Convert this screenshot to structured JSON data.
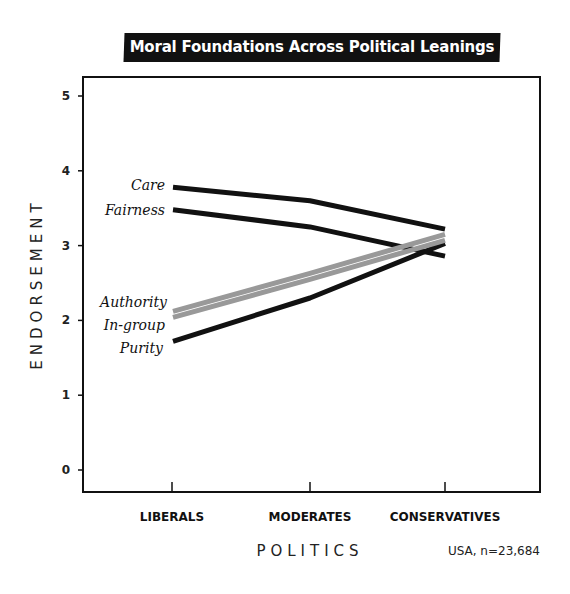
{
  "chart_data": {
    "type": "line",
    "title": "Moral Foundations Across Political Leanings",
    "xlabel": "POLITICS",
    "ylabel": "ENDORSEMENT",
    "note": "USA, n=23,684",
    "categories": [
      "LIBERALS",
      "MODERATES",
      "CONSERVATIVES"
    ],
    "yticks": [
      "0",
      "1",
      "2",
      "3",
      "4",
      "5"
    ],
    "ylim": [
      0,
      5
    ],
    "grid": false,
    "legend_position": "inline-left",
    "series": [
      {
        "name": "Care",
        "values": [
          3.78,
          3.6,
          3.22
        ],
        "color": "#111111"
      },
      {
        "name": "Fairness",
        "values": [
          3.48,
          3.25,
          2.86
        ],
        "color": "#111111"
      },
      {
        "name": "Authority",
        "values": [
          2.12,
          2.63,
          3.15
        ],
        "color": "#999999"
      },
      {
        "name": "In-group",
        "values": [
          2.04,
          2.55,
          3.07
        ],
        "color": "#999999"
      },
      {
        "name": "Purity",
        "values": [
          1.72,
          2.3,
          3.03
        ],
        "color": "#111111"
      }
    ]
  }
}
